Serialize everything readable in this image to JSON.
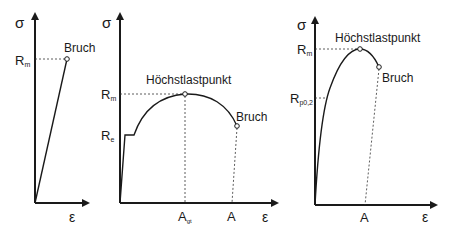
{
  "diagrams": [
    {
      "name": "brittle",
      "y_axis_label": "σ",
      "x_axis_label": "ε",
      "rm_label": "R",
      "rm_sub": "m",
      "break_label": "Bruch"
    },
    {
      "name": "ductile-with-yield-point",
      "y_axis_label": "σ",
      "x_axis_label": "ε",
      "rm_label": "R",
      "rm_sub": "m",
      "re_label": "R",
      "re_sub": "e",
      "max_label": "Höchstlastpunkt",
      "break_label": "Bruch",
      "agt_label": "A",
      "agt_sub": "gt",
      "a_label": "A"
    },
    {
      "name": "ductile-without-yield-point",
      "y_axis_label": "σ",
      "x_axis_label": "ε",
      "rm_label": "R",
      "rm_sub": "m",
      "rp_label": "R",
      "rp_sub": "p0,2",
      "max_label": "Höchstlastpunkt",
      "break_label": "Bruch",
      "a_label": "A"
    }
  ]
}
